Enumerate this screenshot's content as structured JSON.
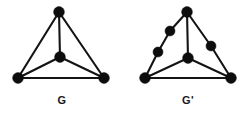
{
  "figure": {
    "width": 249,
    "height": 117,
    "background_color": "#ffffff",
    "ink_color": "#141414",
    "vertex_color": "#0d0d0d",
    "vertex_radius": 5.2,
    "edge_width": 2.1
  },
  "graphs": [
    {
      "id": "graph-g",
      "label": "G",
      "label_position": {
        "x": 62,
        "y": 100
      },
      "vertices": [
        {
          "id": "g-top",
          "name": "top-vertex",
          "x": 59,
          "y": 12,
          "r": 5.4
        },
        {
          "id": "g-center",
          "name": "center-vertex",
          "x": 60,
          "y": 57,
          "r": 5.4
        },
        {
          "id": "g-bottom-left",
          "name": "bottom-left-vertex",
          "x": 18,
          "y": 78,
          "r": 5.4
        },
        {
          "id": "g-bottom-right",
          "name": "bottom-right-vertex",
          "x": 104,
          "y": 78,
          "r": 5.4
        }
      ],
      "edges": [
        {
          "from": "g-top",
          "to": "g-bottom-left",
          "name": "edge-top-bottomleft"
        },
        {
          "from": "g-top",
          "to": "g-bottom-right",
          "name": "edge-top-bottomright"
        },
        {
          "from": "g-top",
          "to": "g-center",
          "name": "edge-top-center"
        },
        {
          "from": "g-bottom-left",
          "to": "g-bottom-right",
          "name": "edge-bottomleft-bottomright"
        },
        {
          "from": "g-bottom-left",
          "to": "g-center",
          "name": "edge-bottomleft-center"
        },
        {
          "from": "g-center",
          "to": "g-bottom-right",
          "name": "edge-center-bottomright"
        }
      ]
    },
    {
      "id": "graph-g-prime",
      "label": "G'",
      "label_position": {
        "x": 188,
        "y": 100
      },
      "vertices": [
        {
          "id": "gp-top",
          "name": "top-vertex",
          "x": 187,
          "y": 12,
          "r": 5.4
        },
        {
          "id": "gp-center",
          "name": "center-vertex",
          "x": 188,
          "y": 58,
          "r": 5.4
        },
        {
          "id": "gp-bottom-left",
          "name": "bottom-left-vertex",
          "x": 145,
          "y": 78,
          "r": 5.4
        },
        {
          "id": "gp-bottom-right",
          "name": "bottom-right-vertex",
          "x": 231,
          "y": 78,
          "r": 5.4
        },
        {
          "id": "gp-sub-left-1",
          "name": "subdivision-vertex-upper-left-a",
          "x": 170,
          "y": 31,
          "r": 5.0
        },
        {
          "id": "gp-sub-left-2",
          "name": "subdivision-vertex-upper-left-b",
          "x": 158,
          "y": 52,
          "r": 5.0
        },
        {
          "id": "gp-sub-right-1",
          "name": "subdivision-vertex-upper-right",
          "x": 211,
          "y": 46,
          "r": 5.0
        }
      ],
      "edges": [
        {
          "from": "gp-top",
          "to": "gp-sub-left-1",
          "name": "edge-top-subleft1"
        },
        {
          "from": "gp-sub-left-1",
          "to": "gp-sub-left-2",
          "name": "edge-subleft1-subleft2"
        },
        {
          "from": "gp-sub-left-2",
          "to": "gp-bottom-left",
          "name": "edge-subleft2-bottomleft"
        },
        {
          "from": "gp-top",
          "to": "gp-sub-right-1",
          "name": "edge-top-subright1"
        },
        {
          "from": "gp-sub-right-1",
          "to": "gp-bottom-right",
          "name": "edge-subright1-bottomright"
        },
        {
          "from": "gp-top",
          "to": "gp-center",
          "name": "edge-top-center"
        },
        {
          "from": "gp-bottom-left",
          "to": "gp-bottom-right",
          "name": "edge-bottomleft-bottomright"
        },
        {
          "from": "gp-bottom-left",
          "to": "gp-center",
          "name": "edge-bottomleft-center"
        },
        {
          "from": "gp-center",
          "to": "gp-bottom-right",
          "name": "edge-center-bottomright"
        }
      ]
    }
  ]
}
